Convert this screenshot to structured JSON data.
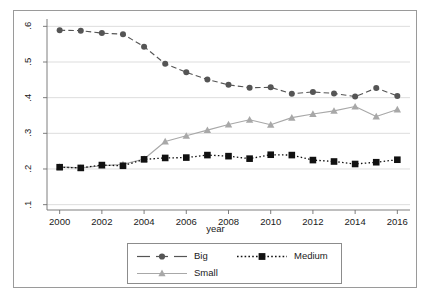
{
  "chart_data": {
    "type": "line",
    "title": "",
    "subtitle": "",
    "xlabel": "year",
    "ylabel": "",
    "x": [
      2000,
      2001,
      2002,
      2003,
      2004,
      2005,
      2006,
      2007,
      2008,
      2009,
      2010,
      2011,
      2012,
      2013,
      2014,
      2015,
      2016
    ],
    "xtick_labels": [
      "2000",
      "2002",
      "2004",
      "2006",
      "2008",
      "2010",
      "2012",
      "2014",
      "2016"
    ],
    "xtick_values": [
      2000,
      2002,
      2004,
      2006,
      2008,
      2010,
      2012,
      2014,
      2016
    ],
    "ytick_labels": [
      ".1",
      ".2",
      ".3",
      ".4",
      ".5",
      ".6"
    ],
    "ytick_values": [
      0.1,
      0.2,
      0.3,
      0.4,
      0.5,
      0.6
    ],
    "xlim": [
      1999.4,
      2016.6
    ],
    "ylim": [
      0.085,
      0.615
    ],
    "grid": "horizontal",
    "legend_position": "bottom-center",
    "series": [
      {
        "name": "Big",
        "color": "#555555",
        "marker": "circle",
        "linestyle": "dashed",
        "values": [
          0.589,
          0.588,
          0.581,
          0.578,
          0.543,
          0.495,
          0.471,
          0.451,
          0.436,
          0.428,
          0.429,
          0.411,
          0.416,
          0.412,
          0.403,
          0.427,
          0.405
        ]
      },
      {
        "name": "Medium",
        "color": "#111111",
        "marker": "square",
        "linestyle": "dotted",
        "values": [
          0.205,
          0.203,
          0.211,
          0.209,
          0.227,
          0.231,
          0.232,
          0.239,
          0.236,
          0.229,
          0.24,
          0.239,
          0.225,
          0.221,
          0.214,
          0.219,
          0.226
        ]
      },
      {
        "name": "Small",
        "color": "#a8a8a8",
        "marker": "triangle",
        "linestyle": "solid",
        "values": [
          0.206,
          0.203,
          0.209,
          0.213,
          0.228,
          0.277,
          0.293,
          0.309,
          0.325,
          0.338,
          0.324,
          0.344,
          0.354,
          0.363,
          0.375,
          0.347,
          0.367
        ]
      }
    ]
  },
  "legend": {
    "entries": [
      {
        "label": "Big"
      },
      {
        "label": "Medium"
      },
      {
        "label": "Small"
      }
    ]
  },
  "axis": {
    "x_title": "year"
  },
  "colors": {
    "big": "#555555",
    "medium": "#111111",
    "small": "#a8a8a8",
    "grid": "#d9d9d9",
    "axis": "#6f6f6f",
    "frame": "#9a9a9a",
    "background": "#ffffff"
  }
}
